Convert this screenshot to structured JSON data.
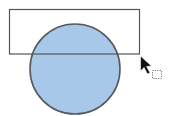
{
  "canvas": {
    "shapes": [
      {
        "kind": "circle",
        "name": "blue-circle",
        "fill": "#a8c8ea",
        "stroke": "#555a60"
      },
      {
        "kind": "rectangle",
        "name": "selection-rectangle",
        "fill": "none",
        "stroke": "#555555"
      }
    ],
    "cursor": {
      "icon": "arrow-pointer-icon",
      "drag_indicator": "dotted-rectangle-icon"
    }
  }
}
